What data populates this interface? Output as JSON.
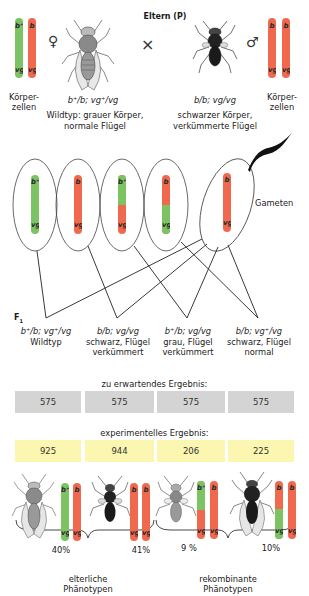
{
  "colors": {
    "green": "#7cc363",
    "red": "#f0694f",
    "gray_box": "#d4d4d4",
    "yellow_box": "#fbf6b0",
    "line": "#222222"
  },
  "parents": {
    "title": "Eltern (P)",
    "cross_symbol": "×",
    "female": {
      "symbol": "♀",
      "cells_label_1": "Körper-",
      "cells_label_2": "zellen",
      "genotype": "b⁺/b; vg⁺/vg",
      "phenotype_1": "Wildtyp: grauer Körper,",
      "phenotype_2": "normale Flügel",
      "chromosomes": [
        {
          "top": "b⁺",
          "bottom": "vg⁺",
          "color": "green"
        },
        {
          "top": "b",
          "bottom": "vg",
          "color": "red"
        }
      ]
    },
    "male": {
      "symbol": "♂",
      "cells_label_1": "Körper-",
      "cells_label_2": "zellen",
      "genotype": "b/b; vg/vg",
      "phenotype_1": "schwarzer Körper,",
      "phenotype_2": "verkümmerte Flügel",
      "chromosomes": [
        {
          "top": "b",
          "bottom": "vg",
          "color": "red"
        },
        {
          "top": "b",
          "bottom": "vg",
          "color": "red"
        }
      ]
    }
  },
  "gametes": {
    "label": "Gameten",
    "items": [
      {
        "top": "b⁺",
        "bottom": "vg⁺"
      },
      {
        "top": "b",
        "bottom": "vg"
      },
      {
        "top": "b⁺",
        "bottom": "vg"
      },
      {
        "top": "b",
        "bottom": "vg⁺"
      },
      {
        "top": "b",
        "bottom": "vg"
      }
    ]
  },
  "f1": {
    "label": "F",
    "label_sub": "1",
    "offspring": [
      {
        "genotype": "b⁺/b; vg⁺/vg",
        "phenotype_1": "Wildtyp",
        "phenotype_2": ""
      },
      {
        "genotype": "b/b; vg/vg",
        "phenotype_1": "schwarz, Flügel",
        "phenotype_2": "verkümmert"
      },
      {
        "genotype": "b⁺/b; vg/vg",
        "phenotype_1": "grau, Flügel",
        "phenotype_2": "verkümmert"
      },
      {
        "genotype": "b/b; vg⁺/vg",
        "phenotype_1": "schwarz, Flügel",
        "phenotype_2": "normal"
      }
    ]
  },
  "expected": {
    "label": "zu erwartendes Ergebnis:",
    "values": [
      "575",
      "575",
      "575",
      "575"
    ]
  },
  "experimental": {
    "label": "experimentelles Ergebnis:",
    "values": [
      "925",
      "944",
      "206",
      "225"
    ]
  },
  "results": {
    "percentages": [
      "40%",
      "41%",
      "9 %",
      "10%"
    ],
    "parental_label_1": "elterliche",
    "parental_label_2": "Phänotypen",
    "recombinant_label_1": "rekombinante",
    "recombinant_label_2": "Phänotypen"
  }
}
